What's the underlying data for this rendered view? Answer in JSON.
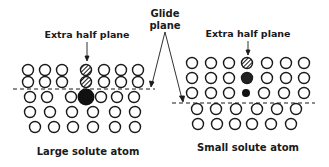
{
  "labels": {
    "glide_plane_line1": "Glide",
    "glide_plane_line2": "plane",
    "left_extra_half_plane": "Extra half plane",
    "right_extra_half_plane": "Extra half plane",
    "left_caption": "Large solute atom",
    "right_caption": "Small solute atom"
  },
  "colors": {
    "ink": "#1a1a1a",
    "background": "#ffffff"
  },
  "panels": [
    {
      "name": "large-solute",
      "rows_above_glide": 2,
      "rows_below_glide": 3,
      "solute_atom": "large, filled, centered at glide plane"
    },
    {
      "name": "small-solute",
      "rows_above_glide": 3,
      "rows_below_glide": 2,
      "solute_atom": "small, filled, just above glide plane"
    }
  ]
}
